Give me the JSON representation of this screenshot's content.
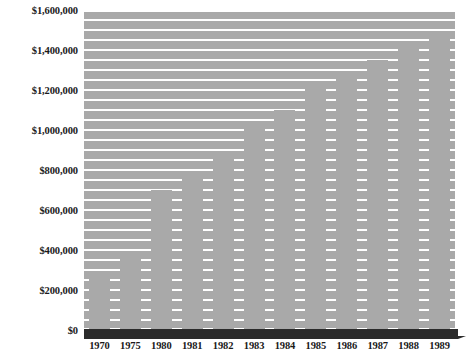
{
  "chart_data": {
    "type": "bar",
    "title": "",
    "xlabel": "",
    "ylabel": "",
    "categories": [
      "1970",
      "1975",
      "1980",
      "1981",
      "1982",
      "1983",
      "1984",
      "1985",
      "1986",
      "1987",
      "1988",
      "1989"
    ],
    "values": [
      265000,
      375000,
      700000,
      795000,
      875000,
      1025000,
      1100000,
      1215000,
      1270000,
      1350000,
      1425000,
      1485000
    ],
    "ylim": [
      0,
      1600000
    ],
    "ytick_values": [
      0,
      200000,
      400000,
      600000,
      800000,
      1000000,
      1200000,
      1400000,
      1600000
    ],
    "ytick_labels": [
      "$0",
      "$200,000",
      "$400,000",
      "$600,000",
      "$800,000",
      "$1,000,000",
      "$1,200,000",
      "$1,400,000",
      "$1,600,000"
    ],
    "gridline_interval": 50000,
    "grid": true,
    "grid_color": "#ffffff",
    "legend": null,
    "legend_position": "none",
    "bar_color": "#a9a9a9",
    "plot_background": "#a9a9a9",
    "baseline_color": "#2b2b2b",
    "page_background": "#ffffff",
    "text_color": "#1a1a1a"
  }
}
